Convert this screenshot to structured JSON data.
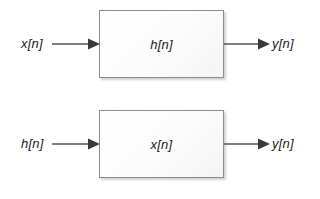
{
  "figure": {
    "type": "block-diagram",
    "background_color": "#ffffff",
    "line_color": "#555555",
    "arrowhead_color": "#3a3a3a",
    "box_border_color": "#8d8d8d",
    "box_fill_color": "#fbfbfb",
    "text_color": "#1a1a1a"
  },
  "diagrams": [
    {
      "id": "top",
      "input_label": "x[n]",
      "block_label": "h[n]",
      "output_label": "y[n]",
      "input_arrow_icon": "arrow-right-icon",
      "output_arrow_icon": "arrow-right-icon"
    },
    {
      "id": "bottom",
      "input_label": "h[n]",
      "block_label": "x[n]",
      "output_label": "y[n]",
      "input_arrow_icon": "arrow-right-icon",
      "output_arrow_icon": "arrow-right-icon"
    }
  ]
}
